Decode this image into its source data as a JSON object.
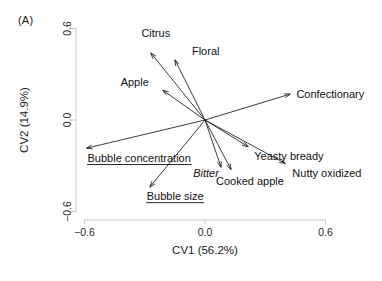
{
  "panel": {
    "label": "(A)"
  },
  "chart_data": {
    "type": "scatter",
    "subtype": "loading-biplot-vectors",
    "title": "(A)",
    "xlabel": "CV1 (56.2%)",
    "ylabel": "CV2 (14.9%)",
    "xlim": [
      -0.72,
      0.72
    ],
    "ylim": [
      -0.72,
      0.72
    ],
    "xticks": [
      -0.6,
      0.0,
      0.6
    ],
    "xticklabels": [
      "−0.6",
      "0.0",
      "0.6"
    ],
    "yticks": [
      -0.6,
      0.0,
      0.6
    ],
    "yticklabels": [
      "−0.6",
      "0.0",
      "0.6"
    ],
    "grid": false,
    "legend": "none",
    "origin": [
      0.0,
      0.0
    ],
    "vectors": [
      {
        "name": "Citrus",
        "x": -0.27,
        "y": 0.44,
        "label": "Citrus",
        "label_x": -0.245,
        "label_y": 0.545,
        "style": "plain",
        "anchor": "middle"
      },
      {
        "name": "Floral",
        "x": -0.15,
        "y": 0.395,
        "label": "Floral",
        "label_x": -0.065,
        "label_y": 0.425,
        "style": "plain",
        "anchor": "start"
      },
      {
        "name": "Apple",
        "x": -0.21,
        "y": 0.195,
        "label": "Apple",
        "label_x": -0.35,
        "label_y": 0.225,
        "style": "plain",
        "anchor": "middle"
      },
      {
        "name": "Confectionary",
        "x": 0.425,
        "y": 0.17,
        "label": "Confectionary",
        "label_x": 0.455,
        "label_y": 0.145,
        "style": "plain",
        "anchor": "start"
      },
      {
        "name": "Bubble concentration",
        "x": -0.59,
        "y": -0.185,
        "label": "Bubble concentration",
        "label_x": -0.585,
        "label_y": -0.275,
        "style": "underline",
        "anchor": "start"
      },
      {
        "name": "Bubble size",
        "x": -0.275,
        "y": -0.44,
        "label": "Bubble size",
        "label_x": -0.29,
        "label_y": -0.525,
        "style": "underline",
        "anchor": "start"
      },
      {
        "name": "Bitter",
        "x": 0.08,
        "y": -0.31,
        "label": "Bitter",
        "label_x": 0.005,
        "label_y": -0.375,
        "style": "italic",
        "anchor": "middle"
      },
      {
        "name": "Cooked apple",
        "x": 0.13,
        "y": -0.325,
        "label": "Cooked apple",
        "label_x": 0.055,
        "label_y": -0.425,
        "style": "plain",
        "anchor": "start"
      },
      {
        "name": "Yeasty bready",
        "x": 0.215,
        "y": -0.175,
        "label": "Yeasty bready",
        "label_x": 0.245,
        "label_y": -0.265,
        "style": "plain",
        "anchor": "start"
      },
      {
        "name": "Nutty oxidized",
        "x": 0.4,
        "y": -0.285,
        "label": "Nutty oxidized",
        "label_x": 0.435,
        "label_y": -0.375,
        "style": "plain",
        "anchor": "start"
      }
    ]
  }
}
